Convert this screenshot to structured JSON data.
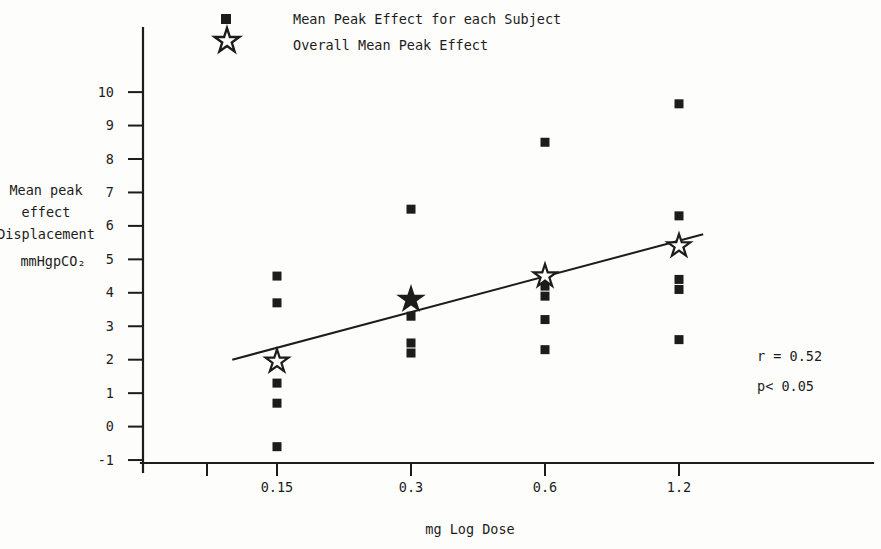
{
  "figure": {
    "background": "#fdfdfb",
    "ink": "#1c1c1c"
  },
  "legend": {
    "items": [
      {
        "marker": "filled-square",
        "label": "Mean Peak Effect for each Subject"
      },
      {
        "marker": "open-star",
        "label": "Overall Mean Peak Effect"
      }
    ]
  },
  "chart_data": {
    "type": "scatter",
    "title": "",
    "xlabel": "mg Log Dose",
    "ylabel_lines": [
      "Mean peak",
      "effect",
      "Displacement",
      "mmHgpCO₂"
    ],
    "x_scale": "log2",
    "x_ticks": [
      {
        "label": "0.15",
        "value": 0.15
      },
      {
        "label": "0.3",
        "value": 0.3
      },
      {
        "label": "0.6",
        "value": 0.6
      },
      {
        "label": "1.2",
        "value": 1.2
      }
    ],
    "y_ticks": [
      10,
      9,
      8,
      7,
      6,
      5,
      4,
      3,
      2,
      1,
      0,
      -1
    ],
    "ylim": [
      -1.1,
      11.9
    ],
    "grid": false,
    "legend_position": "top",
    "series": [
      {
        "name": "Mean Peak Effect for each Subject",
        "marker": "filled-square",
        "points": [
          {
            "x": 0.15,
            "y": 4.5
          },
          {
            "x": 0.15,
            "y": 3.7
          },
          {
            "x": 0.15,
            "y": 1.3
          },
          {
            "x": 0.15,
            "y": 0.7
          },
          {
            "x": 0.15,
            "y": -0.6
          },
          {
            "x": 0.3,
            "y": 6.5
          },
          {
            "x": 0.3,
            "y": 3.8
          },
          {
            "x": 0.3,
            "y": 3.3
          },
          {
            "x": 0.3,
            "y": 2.5
          },
          {
            "x": 0.3,
            "y": 2.2
          },
          {
            "x": 0.6,
            "y": 8.5
          },
          {
            "x": 0.6,
            "y": 4.2
          },
          {
            "x": 0.6,
            "y": 3.9
          },
          {
            "x": 0.6,
            "y": 3.2
          },
          {
            "x": 0.6,
            "y": 2.3
          },
          {
            "x": 1.2,
            "y": 9.65
          },
          {
            "x": 1.2,
            "y": 6.3
          },
          {
            "x": 1.2,
            "y": 4.4
          },
          {
            "x": 1.2,
            "y": 4.1
          },
          {
            "x": 1.2,
            "y": 2.6
          }
        ]
      },
      {
        "name": "Overall Mean Peak Effect",
        "marker": "star",
        "points": [
          {
            "x": 0.15,
            "y": 1.95,
            "filled": false
          },
          {
            "x": 0.3,
            "y": 3.8,
            "filled": true
          },
          {
            "x": 0.6,
            "y": 4.5,
            "filled": false
          },
          {
            "x": 1.2,
            "y": 5.4,
            "filled": false
          }
        ]
      }
    ],
    "fit_line": {
      "x1": 0.119,
      "y1": 2.0,
      "x2": 1.36,
      "y2": 5.75
    },
    "stats": [
      "r = 0.52",
      "p< 0.05"
    ]
  }
}
